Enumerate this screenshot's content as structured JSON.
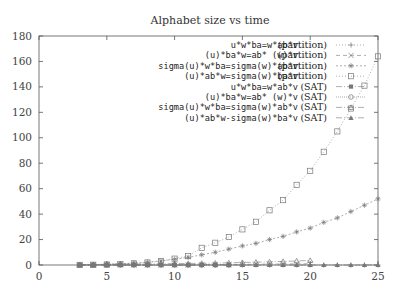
{
  "chart_data": {
    "type": "line",
    "title": "Alphabet size vs time",
    "xlabel": "",
    "ylabel": "",
    "xlim": [
      0,
      25
    ],
    "ylim": [
      0,
      180
    ],
    "xticks": [
      0,
      5,
      10,
      15,
      20,
      25
    ],
    "yticks": [
      0,
      20,
      40,
      60,
      80,
      100,
      120,
      140,
      160,
      180
    ],
    "grid": false,
    "legend_position": "upper right (inside)",
    "series": [
      {
        "name": "u*w*ba=w*ab*v (partition)",
        "marker": "plus",
        "dash": "1,2",
        "x": [
          3,
          4,
          5,
          6,
          7,
          8,
          9,
          10,
          11,
          12,
          13,
          14,
          15,
          16,
          17,
          18,
          19,
          20,
          21,
          22,
          23,
          24,
          25
        ],
        "y": [
          0,
          0,
          0,
          0,
          0,
          0,
          0,
          0,
          0,
          0,
          0,
          0,
          0,
          0,
          0,
          0,
          0,
          0,
          0,
          0,
          0,
          0,
          0
        ]
      },
      {
        "name": "(u)*ba*w=ab* (w)*v (partition)",
        "marker": "cross",
        "dash": "4,3",
        "x": [
          3,
          4,
          5,
          6,
          7,
          8,
          9,
          10,
          11,
          12,
          13,
          14,
          15,
          16,
          17,
          18,
          19,
          20
        ],
        "y": [
          0,
          0,
          0,
          0,
          0,
          0,
          0,
          0,
          0,
          0.2,
          0.3,
          0.4,
          0.5,
          0.6,
          0.7,
          0.8,
          0.9,
          1
        ]
      },
      {
        "name": "sigma(u)*w*ba=sigma(w)*ab*v (partition)",
        "marker": "star",
        "dash": "2,2",
        "x": [
          3,
          4,
          5,
          6,
          7,
          8,
          9,
          10,
          11,
          12,
          13,
          14,
          15,
          16,
          17,
          18,
          19,
          20,
          21,
          22,
          23,
          24,
          25
        ],
        "y": [
          0.1,
          0.3,
          0.6,
          1,
          1.5,
          2.2,
          3.2,
          4.5,
          6,
          8,
          10,
          12.5,
          15,
          17,
          20,
          22.5,
          26,
          29,
          33.5,
          37,
          42,
          47,
          52
        ]
      },
      {
        "name": "(u)*ab*w=sigma(w)*ba*v (partition)",
        "marker": "square",
        "dash": "1,2",
        "x": [
          3,
          4,
          5,
          6,
          7,
          8,
          9,
          10,
          11,
          12,
          13,
          14,
          15,
          16,
          17,
          18,
          19,
          20,
          21,
          22,
          23,
          24,
          25
        ],
        "y": [
          0.1,
          0.2,
          0.4,
          0.8,
          1.3,
          2,
          3.2,
          5,
          7,
          13.5,
          17.5,
          22,
          28,
          34,
          43,
          51,
          63,
          74,
          89,
          105,
          123,
          141,
          164
        ]
      },
      {
        "name": "u*w*ba=w*ab*v (SAT)",
        "marker": "filled-square",
        "dash": "6,2,1,2",
        "x": [
          3,
          4,
          5,
          6,
          7,
          8,
          9,
          10,
          11,
          12,
          13,
          14
        ],
        "y": [
          0,
          0,
          0,
          0,
          0,
          0,
          0,
          0,
          0,
          0,
          0,
          0
        ]
      },
      {
        "name": "(u)*ba*w=ab* (w)*v (SAT)",
        "marker": "circle",
        "dash": "1,1",
        "x": [
          3,
          4,
          5,
          6,
          7,
          8,
          9,
          10,
          11,
          12,
          13,
          14
        ],
        "y": [
          0,
          0,
          0,
          0,
          0,
          0,
          0,
          0,
          0,
          0,
          0,
          0
        ]
      },
      {
        "name": "sigma(u)*w*ba=sigma(w)*ab*v (SAT)",
        "marker": "triangle",
        "dash": "6,2,1,2",
        "x": [
          3,
          4,
          5,
          6,
          7,
          8,
          9,
          10,
          11,
          12,
          13,
          14,
          15,
          16,
          17,
          18,
          19,
          20
        ],
        "y": [
          0.3,
          0.4,
          0.6,
          0.7,
          0.8,
          0.9,
          1,
          1.1,
          1.2,
          1.3,
          1.5,
          1.7,
          2,
          2.2,
          2.5,
          2.8,
          3.2,
          3.6
        ]
      },
      {
        "name": "(u)*ab*w-sigma(w)*ba*v (SAT)",
        "marker": "filled-triangle",
        "dash": "6,2,1,2",
        "x": [
          3,
          4,
          5,
          6,
          7,
          8,
          9,
          10,
          11,
          12,
          13,
          14,
          15,
          16,
          17,
          18,
          19,
          20,
          21,
          22,
          23,
          24,
          25
        ],
        "y": [
          0,
          0,
          0,
          0,
          0,
          0,
          0,
          0,
          0,
          0,
          0,
          0,
          0,
          0,
          0,
          0,
          0,
          0,
          0,
          0,
          0,
          0,
          0
        ]
      }
    ]
  },
  "plot": {
    "title": "Alphabet size vs time",
    "legend": [
      {
        "label": "u*w*ba=w*ab*v",
        "tag": "(partition)"
      },
      {
        "label": "(u)*ba*w=ab* (w)*v",
        "tag": "(partition)"
      },
      {
        "label": "sigma(u)*w*ba=sigma(w)*ab*v",
        "tag": "(partition)"
      },
      {
        "label": "(u)*ab*w=sigma(w)*ba*v",
        "tag": "(partition)"
      },
      {
        "label": "u*w*ba=w*ab*v",
        "tag": "(SAT)"
      },
      {
        "label": "(u)*ba*w=ab* (w)*v",
        "tag": "(SAT)"
      },
      {
        "label": "sigma(u)*w*ba=sigma(w)*ab*v",
        "tag": "(SAT)"
      },
      {
        "label": "(u)*ab*w-sigma(w)*ba*v",
        "tag": "(SAT)"
      }
    ],
    "colors": {
      "axis": "#555555",
      "series": "#777777",
      "text": "#222222"
    }
  }
}
